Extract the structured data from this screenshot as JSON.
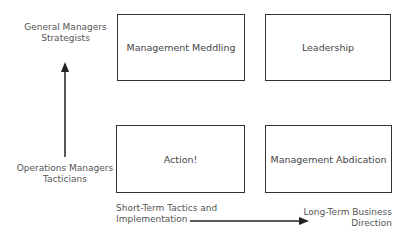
{
  "y_axis": {
    "top_label": [
      "General Managers",
      "Strategists"
    ],
    "bottom_label": [
      "Operations Managers",
      "Tacticians"
    ]
  },
  "x_axis": {
    "left_label": [
      "Short-Term Tactics and",
      "Implementation"
    ],
    "right_label": [
      "Long-Term Business",
      "Direction"
    ]
  },
  "quadrants": {
    "top_left": "Management Meddling",
    "top_right": "Leadership",
    "bottom_left": "Action!",
    "bottom_right": "Management Abdication"
  },
  "colors": {
    "line": "#333333",
    "text": "#444444"
  }
}
